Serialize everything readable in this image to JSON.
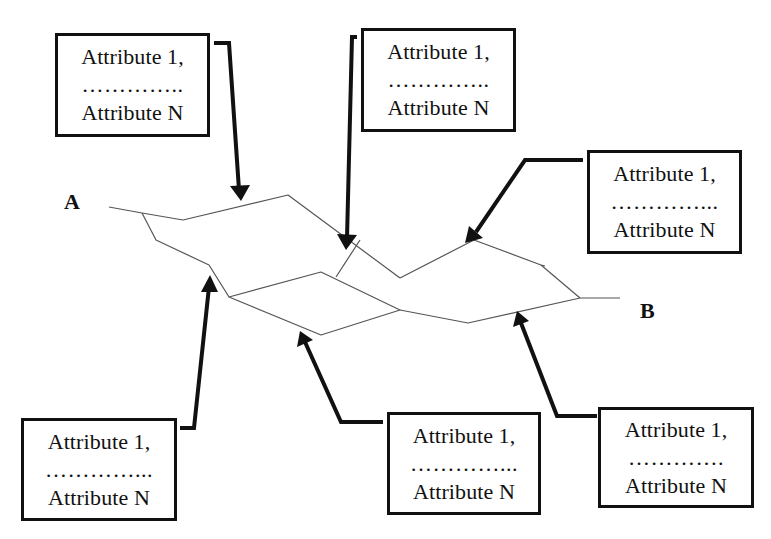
{
  "diagram": {
    "type": "road-network-segment-attributes",
    "node_labels": {
      "start": "A",
      "end": "B"
    },
    "colors": {
      "ink": "#111111",
      "network_line": "#555555",
      "background": "#ffffff"
    },
    "attribute_boxes": [
      {
        "id": "box-top-left",
        "first": "Attribute 1,",
        "ellipsis": "…………..",
        "last": "Attribute N"
      },
      {
        "id": "box-top-center",
        "first": "Attribute 1,",
        "ellipsis": "…………..",
        "last": "Attribute N"
      },
      {
        "id": "box-right",
        "first": "Attribute 1,",
        "ellipsis": "…………...",
        "last": "Attribute N"
      },
      {
        "id": "box-bottom-left",
        "first": "Attribute 1,",
        "ellipsis": "…………...",
        "last": "Attribute N"
      },
      {
        "id": "box-bottom-center",
        "first": "Attribute 1,",
        "ellipsis": "…………...",
        "last": "Attribute N"
      },
      {
        "id": "box-bottom-right",
        "first": "Attribute 1,",
        "ellipsis": "………….",
        "last": "Attribute N"
      }
    ]
  }
}
